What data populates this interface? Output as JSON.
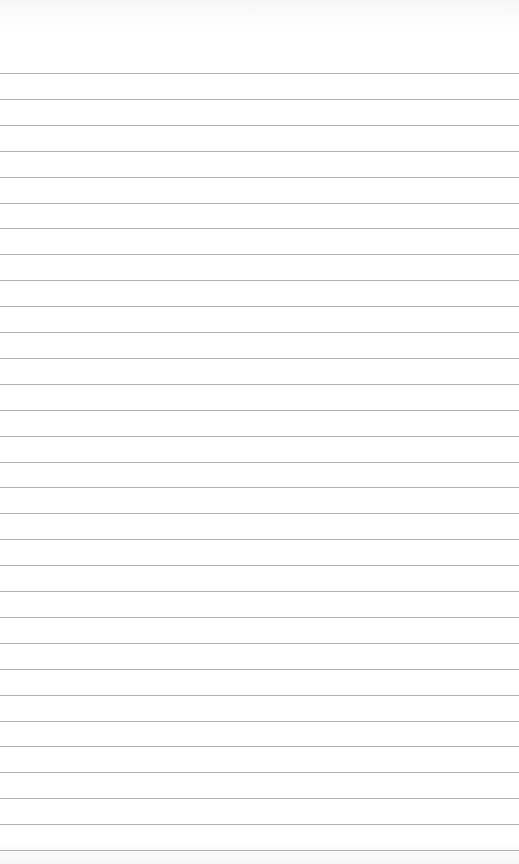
{
  "page": {
    "type": "lined-paper",
    "background_color": "#ffffff",
    "line_color": "#a3a3a3",
    "first_line_y": 73,
    "line_spacing": 25.9,
    "line_count": 31
  }
}
